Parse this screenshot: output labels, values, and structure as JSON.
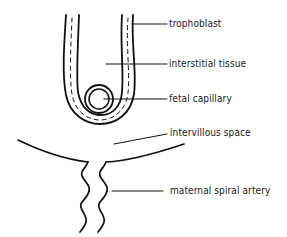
{
  "diagram": {
    "labels": [
      {
        "id": "trophoblast",
        "text": "trophoblast",
        "x": 169,
        "y": 17
      },
      {
        "id": "interstitial-tissue",
        "text": "interstitial tissue",
        "x": 169,
        "y": 57
      },
      {
        "id": "fetal-capillary",
        "text": "fetal capillary",
        "x": 169,
        "y": 93
      },
      {
        "id": "intervillous-space",
        "text": "intervillous space",
        "x": 170,
        "y": 127
      },
      {
        "id": "maternal-spiral-artery",
        "text": "maternal spiral artery",
        "x": 170,
        "y": 185
      }
    ],
    "colors": {
      "line": "#111111",
      "background": "#ffffff"
    }
  }
}
